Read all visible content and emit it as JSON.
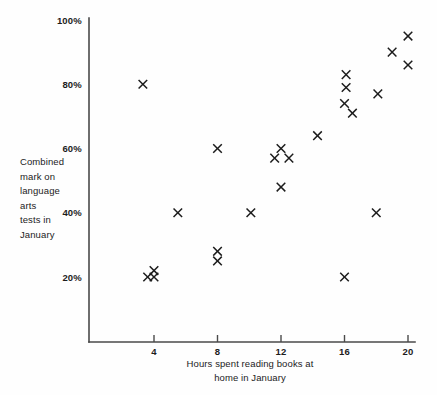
{
  "chart_data": {
    "type": "scatter",
    "title": "",
    "xlabel": "Hours spent reading books at home in January",
    "ylabel": "Combined mark on language arts tests in January",
    "xlabel_lines": [
      "Hours spent reading books at",
      "home in January"
    ],
    "ylabel_lines": [
      "Combined",
      "mark on",
      "language",
      "arts",
      "tests in",
      "January"
    ],
    "xlim": [
      0,
      21.5
    ],
    "ylim": [
      0,
      104
    ],
    "xticks": [
      4,
      8,
      12,
      16,
      20
    ],
    "xtick_labels": [
      "4",
      "8",
      "12",
      "16",
      "20"
    ],
    "yticks": [
      20,
      40,
      60,
      80,
      100
    ],
    "ytick_labels": [
      "20%",
      "40%",
      "60%",
      "80%",
      "100%"
    ],
    "grid": false,
    "legend": false,
    "marker": "x",
    "marker_color": "#1c1c1c",
    "axis_color": "#4a4a4a",
    "points": [
      {
        "x": 3.6,
        "y": 20
      },
      {
        "x": 4.0,
        "y": 22
      },
      {
        "x": 4.0,
        "y": 20
      },
      {
        "x": 3.3,
        "y": 80
      },
      {
        "x": 5.5,
        "y": 40
      },
      {
        "x": 8.0,
        "y": 60
      },
      {
        "x": 8.0,
        "y": 28
      },
      {
        "x": 8.0,
        "y": 25
      },
      {
        "x": 10.1,
        "y": 40
      },
      {
        "x": 11.6,
        "y": 57
      },
      {
        "x": 12.0,
        "y": 60
      },
      {
        "x": 12.5,
        "y": 57
      },
      {
        "x": 12.0,
        "y": 48
      },
      {
        "x": 14.3,
        "y": 64
      },
      {
        "x": 16.1,
        "y": 83
      },
      {
        "x": 16.1,
        "y": 79
      },
      {
        "x": 16.0,
        "y": 74
      },
      {
        "x": 16.5,
        "y": 71
      },
      {
        "x": 16.0,
        "y": 20
      },
      {
        "x": 18.0,
        "y": 40
      },
      {
        "x": 18.1,
        "y": 77
      },
      {
        "x": 19.0,
        "y": 90
      },
      {
        "x": 20.0,
        "y": 95
      },
      {
        "x": 20.0,
        "y": 86
      }
    ]
  }
}
